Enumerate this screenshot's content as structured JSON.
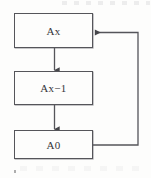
{
  "diagram": {
    "title": "",
    "type": "flowchart",
    "stroke_color": "#55555a",
    "text_color": "#35353a",
    "background_color": "#fdfdfc",
    "nodes": [
      {
        "id": "ax",
        "label": "Ax",
        "shape": "rectangle"
      },
      {
        "id": "ax-1",
        "label": "Ax−1",
        "shape": "rectangle"
      },
      {
        "id": "a0",
        "label": "A0",
        "shape": "rectangle"
      }
    ],
    "edges": [
      {
        "id": "ax-to-ax-1",
        "from": "ax",
        "to": "ax-1",
        "label": "",
        "arrow": "down"
      },
      {
        "id": "ax-1-to-a0",
        "from": "ax-1",
        "to": "a0",
        "label": "",
        "arrow": "down"
      },
      {
        "id": "a0-to-ax",
        "from": "a0",
        "to": "ax",
        "label": "",
        "arrow": "left",
        "routing": "feedback-right"
      }
    ]
  }
}
